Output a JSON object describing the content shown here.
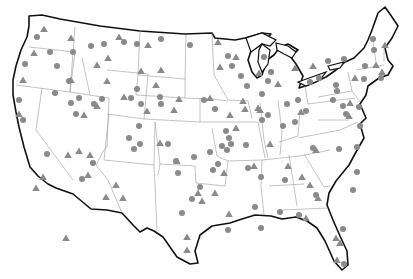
{
  "map": {
    "title": "",
    "region": "Contiguous United States",
    "colors": {
      "background": "#ffffff",
      "outline": "#111111",
      "state_border": "#9a9a9a",
      "marker": "#8a8a8a"
    },
    "marker_types": [
      "circle",
      "triangle"
    ],
    "circles": [
      [
        37,
        37
      ],
      [
        50,
        52
      ],
      [
        25,
        64
      ],
      [
        57,
        66
      ],
      [
        73,
        52
      ],
      [
        91,
        46
      ],
      [
        104,
        44
      ],
      [
        124,
        42
      ],
      [
        137,
        44
      ],
      [
        161,
        39
      ],
      [
        190,
        45
      ],
      [
        19,
        100
      ],
      [
        23,
        120
      ],
      [
        55,
        93
      ],
      [
        69,
        81
      ],
      [
        71,
        103
      ],
      [
        94,
        104
      ],
      [
        102,
        99
      ],
      [
        137,
        89
      ],
      [
        131,
        98
      ],
      [
        160,
        97
      ],
      [
        129,
        138
      ],
      [
        140,
        144
      ],
      [
        141,
        104
      ],
      [
        134,
        149
      ],
      [
        168,
        144
      ],
      [
        176,
        161
      ],
      [
        204,
        100
      ],
      [
        215,
        109
      ],
      [
        226,
        131
      ],
      [
        229,
        138
      ],
      [
        227,
        150
      ],
      [
        246,
        145
      ],
      [
        210,
        152
      ],
      [
        213,
        170
      ],
      [
        194,
        157
      ],
      [
        178,
        173
      ],
      [
        192,
        199
      ],
      [
        200,
        187
      ],
      [
        182,
        213
      ],
      [
        222,
        146
      ],
      [
        231,
        144
      ],
      [
        248,
        168
      ],
      [
        255,
        207
      ],
      [
        261,
        228
      ],
      [
        228,
        230
      ],
      [
        261,
        177
      ],
      [
        285,
        180
      ],
      [
        299,
        215
      ],
      [
        280,
        212
      ],
      [
        316,
        195
      ],
      [
        343,
        229
      ],
      [
        344,
        264
      ],
      [
        357,
        147
      ],
      [
        353,
        190
      ],
      [
        357,
        172
      ],
      [
        339,
        149
      ],
      [
        360,
        126
      ],
      [
        346,
        114
      ],
      [
        343,
        106
      ],
      [
        333,
        100
      ],
      [
        337,
        91
      ],
      [
        359,
        107
      ],
      [
        364,
        79
      ],
      [
        365,
        66
      ],
      [
        374,
        50
      ],
      [
        373,
        39
      ],
      [
        344,
        59
      ],
      [
        328,
        61
      ],
      [
        336,
        85
      ],
      [
        319,
        78
      ],
      [
        310,
        82
      ],
      [
        298,
        100
      ],
      [
        287,
        104
      ],
      [
        306,
        111
      ],
      [
        295,
        122
      ],
      [
        268,
        81
      ],
      [
        262,
        94
      ],
      [
        268,
        115
      ],
      [
        283,
        126
      ],
      [
        313,
        148
      ],
      [
        262,
        120
      ],
      [
        241,
        76
      ],
      [
        228,
        56
      ],
      [
        247,
        86
      ],
      [
        264,
        57
      ],
      [
        232,
        66
      ],
      [
        161,
        104
      ],
      [
        76,
        114
      ],
      [
        79,
        98
      ],
      [
        47,
        154
      ],
      [
        82,
        179
      ],
      [
        93,
        163
      ],
      [
        139,
        126
      ],
      [
        218,
        164
      ],
      [
        271,
        72
      ],
      [
        381,
        78
      ]
    ],
    "triangles": [
      [
        44,
        29
      ],
      [
        71,
        38
      ],
      [
        34,
        53
      ],
      [
        23,
        80
      ],
      [
        71,
        80
      ],
      [
        119,
        37
      ],
      [
        148,
        45
      ],
      [
        108,
        58
      ],
      [
        161,
        70
      ],
      [
        107,
        81
      ],
      [
        156,
        85
      ],
      [
        236,
        57
      ],
      [
        218,
        42
      ],
      [
        220,
        67
      ],
      [
        259,
        73
      ],
      [
        260,
        110
      ],
      [
        243,
        101
      ],
      [
        230,
        115
      ],
      [
        236,
        128
      ],
      [
        179,
        99
      ],
      [
        174,
        110
      ],
      [
        147,
        111
      ],
      [
        141,
        71
      ],
      [
        124,
        97
      ],
      [
        97,
        65
      ],
      [
        84,
        115
      ],
      [
        97,
        106
      ],
      [
        90,
        155
      ],
      [
        88,
        175
      ],
      [
        79,
        151
      ],
      [
        68,
        155
      ],
      [
        43,
        177
      ],
      [
        106,
        197
      ],
      [
        116,
        185
      ],
      [
        123,
        198
      ],
      [
        160,
        143
      ],
      [
        177,
        161
      ],
      [
        198,
        193
      ],
      [
        202,
        201
      ],
      [
        215,
        193
      ],
      [
        229,
        214
      ],
      [
        224,
        173
      ],
      [
        254,
        166
      ],
      [
        270,
        144
      ],
      [
        288,
        166
      ],
      [
        302,
        177
      ],
      [
        310,
        185
      ],
      [
        318,
        198
      ],
      [
        306,
        218
      ],
      [
        336,
        238
      ],
      [
        337,
        260
      ],
      [
        340,
        243
      ],
      [
        316,
        150
      ],
      [
        350,
        103
      ],
      [
        385,
        45
      ],
      [
        382,
        72
      ],
      [
        376,
        65
      ],
      [
        355,
        78
      ],
      [
        349,
        116
      ],
      [
        301,
        112
      ],
      [
        295,
        68
      ],
      [
        313,
        66
      ],
      [
        258,
        108
      ],
      [
        278,
        84
      ],
      [
        245,
        109
      ],
      [
        187,
        237
      ],
      [
        187,
        250
      ],
      [
        210,
        98
      ],
      [
        66,
        238
      ],
      [
        36,
        188
      ],
      [
        19,
        114
      ]
    ]
  }
}
